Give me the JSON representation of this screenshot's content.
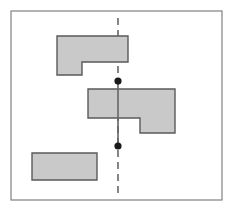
{
  "figure": {
    "title": "Shapes with a dashed vertical axis",
    "canvas": {
      "width": 232,
      "height": 211,
      "background": "#ffffff"
    },
    "frame": {
      "name": "outer-border",
      "x": 11,
      "y": 11,
      "width": 211,
      "height": 189,
      "stroke": "#808080",
      "stroke_width": 1.2,
      "fill": "#ffffff"
    },
    "style": {
      "shape_fill": "#c9c9c9",
      "shape_stroke": "#5a5a5a",
      "shape_stroke_width": 1.4,
      "line_color": "#666666",
      "dot_color": "#1a1a1a"
    },
    "shapes": [
      {
        "id": "shape-top-l",
        "label": "top L-shaped polygon",
        "type": "polygon",
        "points": "57,36 128,36 128,62 82,62 82,75 57,75",
        "bbox": [
          57,
          36,
          128,
          75
        ]
      },
      {
        "id": "shape-middle-l",
        "label": "middle L-shaped polygon",
        "type": "polygon",
        "points": "88,89 175,89 175,133 140,133 140,118 88,118",
        "bbox": [
          88,
          89,
          175,
          133
        ]
      },
      {
        "id": "shape-bottom-rect",
        "label": "bottom rectangle",
        "type": "polygon",
        "points": "32,153 97,153 97,180 32,180",
        "bbox": [
          32,
          153,
          97,
          180
        ]
      }
    ],
    "axis": {
      "id": "vertical-axis",
      "label": "dashed vertical axis line",
      "x": 118,
      "y_top": 18,
      "y_bottom": 193,
      "dash_pattern": "7 5",
      "solid_segment": {
        "y_start": 81,
        "y_end": 146
      }
    },
    "markers": [
      {
        "id": "marker-upper",
        "label": "upper point marker",
        "cx": 118,
        "cy": 81,
        "r": 3.6
      },
      {
        "id": "marker-lower",
        "label": "lower point marker",
        "cx": 118,
        "cy": 146,
        "r": 3.6
      }
    ]
  }
}
